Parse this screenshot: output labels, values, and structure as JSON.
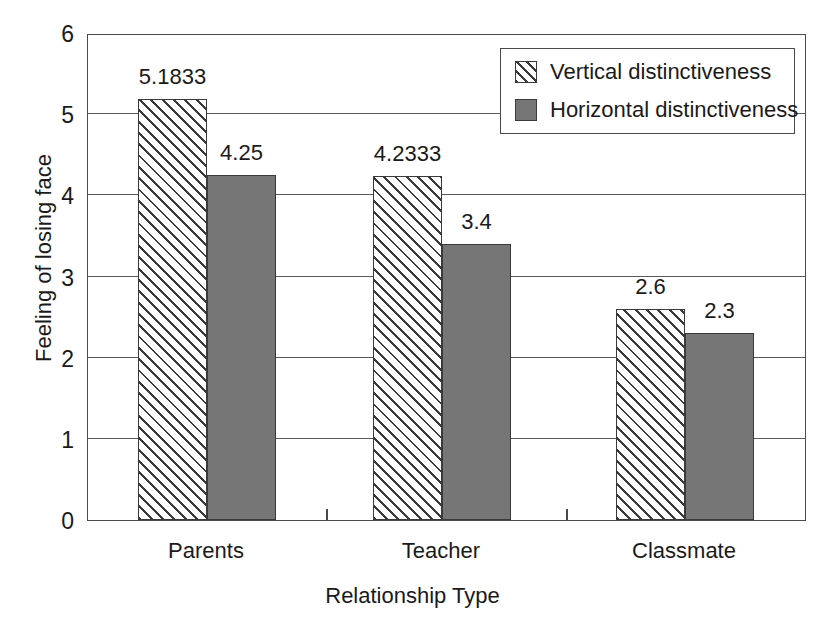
{
  "chart_data": {
    "type": "bar",
    "title": "",
    "xlabel": "Relationship Type",
    "ylabel": "Feeling of losing face",
    "categories": [
      "Parents",
      "Teacher",
      "Classmate"
    ],
    "series": [
      {
        "name": "Vertical distinctiveness",
        "style": "hatched",
        "values": [
          5.1833,
          4.2333,
          2.6
        ],
        "labels": [
          "5.1833",
          "4.2333",
          "2.6"
        ]
      },
      {
        "name": "Horizontal distinctiveness",
        "style": "solid-gray",
        "color": "#767676",
        "values": [
          4.25,
          3.4,
          2.3
        ],
        "labels": [
          "4.25",
          "3.4",
          "2.3"
        ]
      }
    ],
    "ylim": [
      0,
      6
    ],
    "yticks": [
      0,
      1,
      2,
      3,
      4,
      5,
      6
    ],
    "ytick_labels": [
      "0",
      "1",
      "2",
      "3",
      "4",
      "5",
      "6"
    ],
    "grid": "horizontal",
    "legend_position": "top-right",
    "legend_entries": [
      "Vertical distinctiveness",
      "Horizontal distinctiveness"
    ]
  },
  "axis": {
    "y_title": "Feeling of losing face",
    "x_title": "Relationship Type"
  },
  "legend": {
    "entries": [
      {
        "label": "Vertical distinctiveness"
      },
      {
        "label": "Horizontal distinctiveness"
      }
    ]
  }
}
